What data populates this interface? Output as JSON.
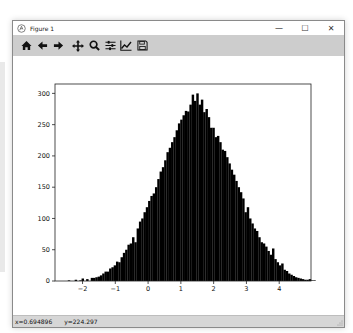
{
  "window": {
    "title": "Figure 1",
    "controls": {
      "minimize": "—",
      "maximize": "☐",
      "close": "✕"
    }
  },
  "toolbar": {
    "buttons": [
      {
        "name": "home",
        "icon": "home-icon",
        "label": "Home"
      },
      {
        "name": "back",
        "icon": "arrow-left-icon",
        "label": "Back"
      },
      {
        "name": "forward",
        "icon": "arrow-right-icon",
        "label": "Forward"
      },
      {
        "name": "pan",
        "icon": "move-icon",
        "label": "Pan"
      },
      {
        "name": "zoom",
        "icon": "magnifier-icon",
        "label": "Zoom"
      },
      {
        "name": "subplots",
        "icon": "sliders-icon",
        "label": "Configure subplots"
      },
      {
        "name": "edit",
        "icon": "line-chart-icon",
        "label": "Edit axis"
      },
      {
        "name": "save",
        "icon": "floppy-icon",
        "label": "Save"
      }
    ]
  },
  "status": {
    "x": "x=0.694896",
    "y": "y=224.297"
  },
  "chart_data": {
    "type": "bar",
    "title": "",
    "xlabel": "",
    "ylabel": "",
    "xlim": [
      -2.84,
      4.97
    ],
    "ylim": [
      0,
      315
    ],
    "xticks": [
      -2,
      -1,
      0,
      1,
      2,
      3,
      4
    ],
    "yticks": [
      0,
      50,
      100,
      150,
      200,
      250,
      300
    ],
    "grid": false,
    "legend": null,
    "bar_color": "#000000",
    "bin_start": -2.45,
    "bin_width": 0.07,
    "values": [
      1,
      0,
      0,
      2,
      0,
      1,
      4,
      0,
      3,
      0,
      5,
      5,
      6,
      7,
      9,
      12,
      15,
      15,
      20,
      22,
      25,
      31,
      30,
      38,
      45,
      50,
      58,
      60,
      70,
      62,
      84,
      95,
      100,
      110,
      118,
      128,
      136,
      140,
      150,
      163,
      175,
      182,
      193,
      206,
      213,
      222,
      230,
      241,
      252,
      258,
      265,
      272,
      271,
      282,
      298,
      288,
      300,
      282,
      290,
      270,
      275,
      262,
      245,
      245,
      230,
      232,
      222,
      210,
      208,
      198,
      188,
      178,
      170,
      160,
      150,
      142,
      132,
      110,
      118,
      100,
      92,
      84,
      80,
      70,
      62,
      60,
      55,
      48,
      42,
      52,
      35,
      30,
      25,
      28,
      18,
      16,
      12,
      10,
      8,
      6,
      5,
      4,
      3,
      2,
      2,
      3,
      1,
      1
    ]
  }
}
